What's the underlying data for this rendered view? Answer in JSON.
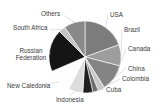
{
  "chart_data": {
    "type": "pie",
    "title": "",
    "subtitle": "",
    "xlabel": "",
    "ylabel": "",
    "legend_position": "none",
    "grid": false,
    "labels_placement": "outside-with-leader-lines",
    "categories": [
      "USA",
      "Brazil",
      "Canada",
      "China",
      "Colombia",
      "Cuba",
      "Indonesia",
      "New Caledonia",
      "Russian Federation",
      "South Africa",
      "Others"
    ],
    "values": [
      19.5,
      9.5,
      12.0,
      3.0,
      2.5,
      4.5,
      6.5,
      11.0,
      19.0,
      3.0,
      9.5
    ],
    "slices": [
      {
        "label": "USA",
        "value": 19.5,
        "color": "#7c7c7c",
        "start_angle": 0,
        "end_angle": 70.2
      },
      {
        "label": "Brazil",
        "value": 9.5,
        "color": "#9d9d9d",
        "start_angle": 70.2,
        "end_angle": 104.4
      },
      {
        "label": "Canada",
        "value": 12.0,
        "color": "#848484",
        "start_angle": 104.4,
        "end_angle": 147.6
      },
      {
        "label": "China",
        "value": 3.0,
        "color": "#c9c9c9",
        "start_angle": 147.6,
        "end_angle": 158.4
      },
      {
        "label": "Colombia",
        "value": 2.5,
        "color": "#6e6e6e",
        "start_angle": 158.4,
        "end_angle": 167.4
      },
      {
        "label": "Cuba",
        "value": 4.5,
        "color": "#1f1f1f",
        "start_angle": 167.4,
        "end_angle": 183.6
      },
      {
        "label": "Indonesia",
        "value": 6.5,
        "color": "#dcdcdc",
        "start_angle": 183.6,
        "end_angle": 207.0
      },
      {
        "label": "New Caledonia",
        "value": 11.0,
        "color": "#fdfdfd",
        "start_angle": 207.0,
        "end_angle": 246.6
      },
      {
        "label": "Russian Federation",
        "value": 19.0,
        "color": "#151515",
        "start_angle": 246.6,
        "end_angle": 315.0
      },
      {
        "label": "South Africa",
        "value": 3.0,
        "color": "#c4c4c4",
        "start_angle": 315.0,
        "end_angle": 325.8
      },
      {
        "label": "Others",
        "value": 9.5,
        "color": "#898989",
        "start_angle": 325.8,
        "end_angle": 360.0
      }
    ],
    "colors": {
      "background": "#ffffff",
      "label_text": "#3a3a3a",
      "slice_outline": "#ffffff"
    },
    "geometry": {
      "center_x": 85,
      "center_y": 57,
      "radius": 36
    }
  }
}
